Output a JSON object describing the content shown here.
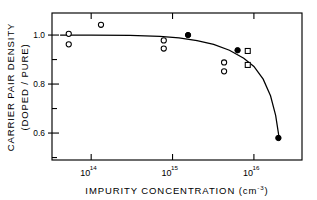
{
  "chart_data": {
    "type": "scatter",
    "title": "",
    "xlabel": "IMPURITY CONCENTRATION (cm-3)",
    "xlabel_main": "IMPURITY CONCENTRATION (cm",
    "xlabel_exp": "-3",
    "xlabel_tail": ")",
    "ylabel_line1": "CARRIER PAIR DENSITY",
    "ylabel_line2": "(DOPED / PURE)",
    "xscale": "log",
    "yscale": "linear",
    "xlim": [
      33000000000000.0,
      3.9e+16
    ],
    "ylim": [
      0.49,
      1.09
    ],
    "grid": false,
    "legend": "none",
    "xticks": [
      {
        "value": 100000000000000.0,
        "mantissa": "10",
        "exponent": "14"
      },
      {
        "value": 1000000000000000.0,
        "mantissa": "10",
        "exponent": "15"
      },
      {
        "value": 1e+16,
        "mantissa": "10",
        "exponent": "16"
      }
    ],
    "yticks_major": [
      {
        "value": 1.0,
        "label": "1.0"
      },
      {
        "value": 0.8,
        "label": "0.8"
      },
      {
        "value": 0.6,
        "label": "0.6"
      }
    ],
    "yticks_minor": [
      0.9,
      0.7,
      0.5
    ],
    "series": [
      {
        "name": "open-circle",
        "marker": "open-circle",
        "points": [
          {
            "x": 53000000000000.0,
            "y": 1.005
          },
          {
            "x": 53000000000000.0,
            "y": 0.962
          },
          {
            "x": 132000000000000.0,
            "y": 1.042
          },
          {
            "x": 780000000000000.0,
            "y": 0.978
          },
          {
            "x": 780000000000000.0,
            "y": 0.945
          },
          {
            "x": 4300000000000000.0,
            "y": 0.888
          },
          {
            "x": 4300000000000000.0,
            "y": 0.852
          }
        ]
      },
      {
        "name": "filled-circle",
        "marker": "filled-circle",
        "points": [
          {
            "x": 1550000000000000.0,
            "y": 1.0
          },
          {
            "x": 6300000000000000.0,
            "y": 0.938
          },
          {
            "x": 2e+16,
            "y": 0.58
          }
        ]
      },
      {
        "name": "open-square",
        "marker": "open-square",
        "points": [
          {
            "x": 8400000000000000.0,
            "y": 0.935
          },
          {
            "x": 8400000000000000.0,
            "y": 0.878
          }
        ]
      }
    ],
    "curve": {
      "name": "model-fit",
      "points": [
        {
          "x": 42000000000000.0,
          "y": 1.0
        },
        {
          "x": 100000000000000.0,
          "y": 1.0
        },
        {
          "x": 300000000000000.0,
          "y": 0.999
        },
        {
          "x": 700000000000000.0,
          "y": 0.995
        },
        {
          "x": 1200000000000000.0,
          "y": 0.988
        },
        {
          "x": 2000000000000000.0,
          "y": 0.977
        },
        {
          "x": 3200000000000000.0,
          "y": 0.962
        },
        {
          "x": 5000000000000000.0,
          "y": 0.938
        },
        {
          "x": 7500000000000000.0,
          "y": 0.905
        },
        {
          "x": 1e+16,
          "y": 0.872
        },
        {
          "x": 1.3e+16,
          "y": 0.82
        },
        {
          "x": 1.6e+16,
          "y": 0.752
        },
        {
          "x": 1.85e+16,
          "y": 0.672
        },
        {
          "x": 2e+16,
          "y": 0.6
        },
        {
          "x": 2.05e+16,
          "y": 0.57
        }
      ]
    }
  }
}
